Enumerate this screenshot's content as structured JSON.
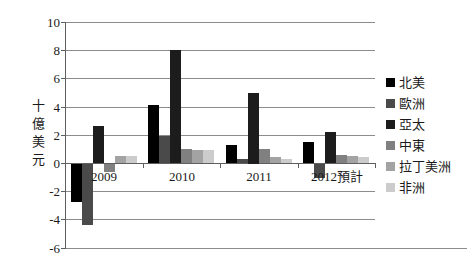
{
  "chart_data": {
    "type": "bar",
    "title": "",
    "ylabel": "十億美元",
    "xlabel": "",
    "categories": [
      "2009",
      "2010",
      "2011",
      "2012預計"
    ],
    "series": [
      {
        "name": "北美",
        "color": "#000000",
        "values": [
          -2.7,
          4.1,
          1.3,
          1.5
        ]
      },
      {
        "name": "歐洲",
        "color": "#4a4a4a",
        "values": [
          -4.3,
          1.9,
          0.3,
          -1.0
        ]
      },
      {
        "name": "亞太",
        "color": "#1c1c1c",
        "values": [
          2.6,
          8.0,
          5.0,
          2.2
        ]
      },
      {
        "name": "中東",
        "color": "#808080",
        "values": [
          -0.6,
          1.0,
          1.0,
          0.6
        ]
      },
      {
        "name": "拉丁美洲",
        "color": "#a3a3a3",
        "values": [
          0.5,
          0.9,
          0.4,
          0.5
        ]
      },
      {
        "name": "非洲",
        "color": "#cccccc",
        "values": [
          0.5,
          0.9,
          0.3,
          0.4
        ]
      }
    ],
    "ylim": [
      -6,
      10
    ],
    "yticks": [
      10,
      8,
      6,
      4,
      2,
      0,
      -2,
      -4,
      -6
    ],
    "grid": true,
    "legend_position": "right",
    "background": "#ffffff",
    "gridline_color": "#8c8c8c",
    "axis_color": "#5f5f5f"
  }
}
